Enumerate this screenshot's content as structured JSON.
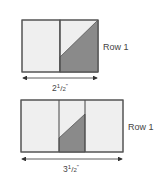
{
  "diagram": {
    "colors": {
      "light_fill": "#efefef",
      "dark_fill": "#8a8a8a",
      "stroke": "#555555",
      "text": "#444444"
    },
    "top_block": {
      "row_label": "Row 1",
      "dimension_whole": "2",
      "dimension_num": "1",
      "dimension_den": "2",
      "dimension_unit": "\""
    },
    "bottom_block": {
      "row_label": "Row 1",
      "dimension_whole": "3",
      "dimension_num": "1",
      "dimension_den": "2",
      "dimension_unit": "\""
    }
  }
}
